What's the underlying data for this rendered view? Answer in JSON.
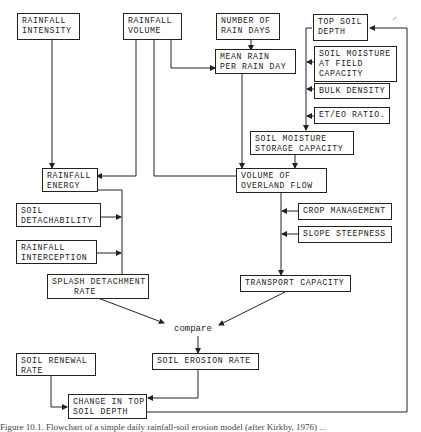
{
  "diagram": {
    "nodes": {
      "rainfall_intensity": "RAINFALL\nINTENSITY",
      "rainfall_volume": "RAINFALL\nVOLUME",
      "number_of_rain_days": "NUMBER OF\nRAIN DAYS",
      "mean_rain_per_rain_day": "MEAN RAIN\nPER RAIN DAY",
      "top_soil_depth": "TOP SOIL\nDEPTH",
      "soil_moisture_field_capacity": "SOIL MOISTURE\nAT FIELD\nCAPACITY",
      "bulk_density": "BULK DENSITY",
      "et_eo_ratio": "ET/EO RATIO.",
      "soil_moisture_storage_capacity": "SOIL MOISTURE\nSTORAGE CAPACITY",
      "rainfall_energy": "RAINFALL\nENERGY",
      "volume_of_overland_flow": "VOLUME OF\nOVERLAND FLOW",
      "soil_detachability": "SOIL\nDETACHABILITY",
      "rainfall_interception": "RAINFALL\nINTERCEPTION",
      "crop_management": "CROP MANAGEMENT",
      "slope_steepness": "SLOPE STEEPNESS",
      "splash_detachment_rate": "SPLASH DETACHMENT\n    RATE",
      "transport_capacity": "TRANSPORT CAPACITY",
      "soil_renewal_rate": "SOIL RENEWAL\nRATE",
      "soil_erosion_rate": "SOIL EROSION RATE",
      "change_in_top_soil_depth": "CHANGE IN TOP\nSOIL DEPTH"
    },
    "compare_label": "compare",
    "caption": "Figure 10.1.  Flowchart of a simple daily rainfall-soil erosion model (after Kirkby, 1976) ..."
  }
}
